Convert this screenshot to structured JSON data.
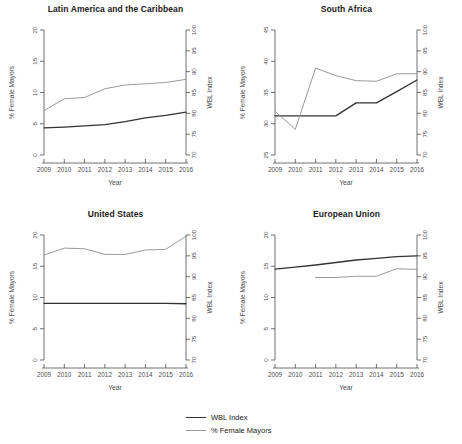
{
  "figure": {
    "xlabel": "Year",
    "ylabel_left": "% Female Mayors",
    "ylabel_right": "WBL Index",
    "years": [
      2009,
      2010,
      2011,
      2012,
      2013,
      2014,
      2015,
      2016
    ],
    "xtick_labels": [
      "2009",
      "2010",
      "2011",
      "2012",
      "2013",
      "2014",
      "2015",
      "2016"
    ],
    "right_axis_ticks": [
      70,
      75,
      80,
      85,
      90,
      95,
      100
    ],
    "right_axis_tick_labels": [
      "70",
      "75",
      "80",
      "85",
      "90",
      "95",
      "100"
    ],
    "colors": {
      "wbl_index": "#333333",
      "female_mayors": "#9a9a9a",
      "axis": "#4d4d4d"
    }
  },
  "legend": {
    "position": "bottom-center",
    "items": [
      {
        "label": "WBL Index",
        "color": "#333333"
      },
      {
        "label": "% Female Mayors",
        "color": "#9a9a9a"
      }
    ]
  },
  "chart_data": [
    {
      "type": "line",
      "title": "Latin America and the Caribbean",
      "xlabel": "Year",
      "ylabel": "% Female Mayors",
      "ylabel_right": "WBL Index",
      "x": [
        2009,
        2010,
        2011,
        2012,
        2013,
        2014,
        2015,
        2016
      ],
      "ylim_left": [
        0,
        20
      ],
      "ytick_left": [
        0,
        5,
        10,
        15,
        20
      ],
      "ytick_left_labels": [
        "0",
        "5",
        "10",
        "15",
        "20"
      ],
      "ylim_right": [
        70,
        100
      ],
      "ytick_right": [
        70,
        75,
        80,
        85,
        90,
        95,
        100
      ],
      "grid": false,
      "series": [
        {
          "name": "WBL Index",
          "axis": "right",
          "color": "#333333",
          "values": [
            76.5,
            76.7,
            77.0,
            77.3,
            78.0,
            78.9,
            79.5,
            80.3
          ]
        },
        {
          "name": "% Female Mayors",
          "axis": "left",
          "color": "#9a9a9a",
          "values": [
            7.1,
            9.0,
            9.2,
            10.6,
            11.2,
            11.4,
            11.6,
            12.1
          ]
        }
      ]
    },
    {
      "type": "line",
      "title": "South Africa",
      "xlabel": "Year",
      "ylabel": "% Female Mayors",
      "ylabel_right": "WBL Index",
      "x": [
        2009,
        2010,
        2011,
        2012,
        2013,
        2014,
        2015,
        2016
      ],
      "ylim_left": [
        25,
        45
      ],
      "ytick_left": [
        25,
        30,
        35,
        40,
        45
      ],
      "ytick_left_labels": [
        "25",
        "30",
        "35",
        "40",
        "45"
      ],
      "ylim_right": [
        70,
        100
      ],
      "ytick_right": [
        70,
        75,
        80,
        85,
        90,
        95,
        100
      ],
      "grid": false,
      "series": [
        {
          "name": "WBL Index",
          "axis": "right",
          "color": "#333333",
          "values": [
            79.4,
            79.4,
            79.4,
            79.4,
            82.5,
            82.5,
            85.2,
            88.0
          ]
        },
        {
          "name": "% Female Mayors",
          "axis": "left",
          "color": "#9a9a9a",
          "values": [
            32.0,
            29.1,
            38.9,
            37.7,
            36.9,
            36.8,
            38.0,
            38.0
          ]
        }
      ]
    },
    {
      "type": "line",
      "title": "United States",
      "xlabel": "Year",
      "ylabel": "% Female Mayors",
      "ylabel_right": "WBL Index",
      "x": [
        2009,
        2010,
        2011,
        2012,
        2013,
        2014,
        2015,
        2016
      ],
      "ylim_left": [
        0,
        20
      ],
      "ytick_left": [
        0,
        5,
        10,
        15,
        20
      ],
      "ytick_left_labels": [
        "0",
        "5",
        "10",
        "15",
        "20"
      ],
      "ylim_right": [
        70,
        100
      ],
      "ytick_right": [
        70,
        75,
        80,
        85,
        90,
        95,
        100
      ],
      "grid": false,
      "series": [
        {
          "name": "WBL Index",
          "axis": "right",
          "color": "#333333",
          "values": [
            83.6,
            83.6,
            83.6,
            83.6,
            83.6,
            83.6,
            83.6,
            83.5
          ]
        },
        {
          "name": "% Female Mayors",
          "axis": "left",
          "color": "#9a9a9a",
          "values": [
            16.8,
            17.9,
            17.8,
            16.9,
            16.9,
            17.6,
            17.7,
            19.8
          ]
        }
      ]
    },
    {
      "type": "line",
      "title": "European Union",
      "xlabel": "Year",
      "ylabel": "% Female Mayors",
      "ylabel_right": "WBL Index",
      "x": [
        2009,
        2010,
        2011,
        2012,
        2013,
        2014,
        2015,
        2016
      ],
      "ylim_left": [
        0,
        20
      ],
      "ytick_left": [
        0,
        5,
        10,
        15,
        20
      ],
      "ytick_left_labels": [
        "0",
        "5",
        "10",
        "15",
        "20"
      ],
      "ylim_right": [
        70,
        100
      ],
      "ytick_right": [
        70,
        75,
        80,
        85,
        90,
        95,
        100
      ],
      "grid": false,
      "series": [
        {
          "name": "WBL Index",
          "axis": "right",
          "color": "#333333",
          "values": [
            91.8,
            92.3,
            92.8,
            93.4,
            94.0,
            94.4,
            94.8,
            95.0
          ]
        },
        {
          "name": "% Female Mayors",
          "axis": "left",
          "color": "#9a9a9a",
          "x": [
            2011,
            2012,
            2013,
            2014,
            2015,
            2016
          ],
          "values": [
            13.2,
            13.2,
            13.4,
            13.4,
            14.6,
            14.5
          ]
        }
      ]
    }
  ]
}
